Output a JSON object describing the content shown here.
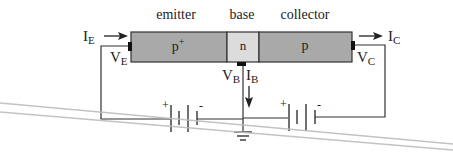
{
  "diagram": {
    "regions": [
      {
        "name": "emitter",
        "doping": "p",
        "doping_sup": "+",
        "color": "#a9a9a9"
      },
      {
        "name": "base",
        "doping": "n",
        "doping_sup": "",
        "color": "#dcdcdc"
      },
      {
        "name": "collector",
        "doping": "p",
        "doping_sup": "",
        "color": "#a9a9a9"
      }
    ],
    "currents": {
      "emitter": {
        "main": "I",
        "sub": "E"
      },
      "base": {
        "main": "I",
        "sub": "B"
      },
      "collector": {
        "main": "I",
        "sub": "C"
      }
    },
    "voltages": {
      "emitter": {
        "main": "V",
        "sub": "E"
      },
      "base": {
        "main": "V",
        "sub": "B"
      },
      "collector": {
        "main": "V",
        "sub": "C"
      }
    },
    "batteries": [
      {
        "id": "left",
        "plus": "+",
        "minus": "-"
      },
      {
        "id": "right",
        "plus": "+",
        "minus": "-"
      }
    ],
    "colors": {
      "wire": "#333333",
      "p_region": "#a9a9a9",
      "n_region": "#dcdcdc",
      "overlay_lines": "#bdbdbd"
    }
  }
}
